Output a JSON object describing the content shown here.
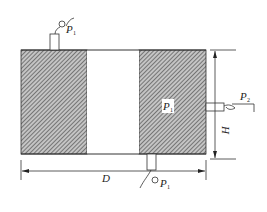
{
  "diagram": {
    "type": "pressure-vessel-cross-section",
    "labels": {
      "top_gauge": {
        "main": "P",
        "sub": "1"
      },
      "right_gauge": {
        "main": "P",
        "sub": "2"
      },
      "inner_pressure": {
        "main": "P",
        "sub": "1"
      },
      "bottom_gauge": {
        "main": "P",
        "sub": "1"
      },
      "width_dimension": "D",
      "height_dimension": "H"
    },
    "colors": {
      "line": "#333333",
      "hatch": "#555555",
      "fill": "#bdbdbd",
      "background": "#ffffff"
    }
  }
}
